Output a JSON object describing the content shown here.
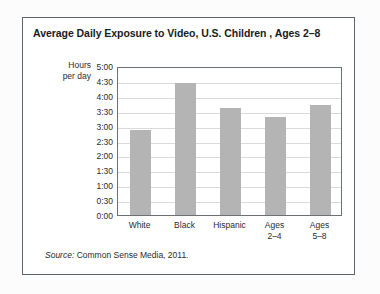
{
  "chart_data": {
    "type": "bar",
    "title": "Average Daily Exposure to Video, U.S. Children , Ages 2–8",
    "xlabel": "",
    "ylabel": "Hours per day",
    "ylabel_lines": [
      "Hours",
      "per day"
    ],
    "categories": [
      "White",
      "Black",
      "Hispanic",
      "Ages 2–4",
      "Ages 5–8"
    ],
    "category_lines": [
      [
        "White"
      ],
      [
        "Black"
      ],
      [
        "Hispanic"
      ],
      [
        "Ages",
        "2–4"
      ],
      [
        "Ages",
        "5–8"
      ]
    ],
    "values": [
      2.85,
      4.42,
      3.58,
      3.28,
      3.7
    ],
    "value_labels": [
      "2:51",
      "4:25",
      "3:35",
      "3:17",
      "3:42"
    ],
    "ylim": [
      0,
      5
    ],
    "ytick_values": [
      5,
      4.5,
      4,
      3.5,
      3,
      2.5,
      2,
      1.5,
      1,
      0.5,
      0
    ],
    "ytick_labels": [
      "5:00",
      "4:30",
      "4:00",
      "3:30",
      "3:00",
      "2:30",
      "2:00",
      "1:30",
      "1:00",
      "0:30",
      "0:00"
    ],
    "grid": true,
    "legend": "none",
    "bar_color": "#b4b4b4",
    "gridline_color": "#d8dbdd",
    "axis_color": "#6a7074",
    "text_color": "#2b2b2b"
  },
  "source": {
    "lead": "Source:",
    "text": " Common Sense Media, 2011."
  }
}
